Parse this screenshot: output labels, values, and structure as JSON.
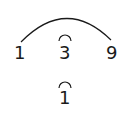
{
  "diagram": {
    "top_row": [
      "1",
      "3",
      "9"
    ],
    "bottom": "1",
    "arcs": [
      {
        "from": "1",
        "to": "9",
        "type": "large-arc"
      },
      {
        "over": "3",
        "type": "small-arc"
      },
      {
        "over": "bottom-1",
        "type": "small-arc"
      }
    ],
    "stroke_color": "#1a1a1a"
  }
}
